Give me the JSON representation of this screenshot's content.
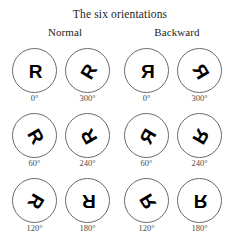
{
  "figure": {
    "title": "The six orientations",
    "circle_stroke_color": "#6b6b6b",
    "glyph_color": "#000000",
    "label_color": "#4a4a4a",
    "background_color": "#ffffff"
  },
  "groups": [
    {
      "key": "normal",
      "header": "Normal",
      "mirrored": false,
      "cells": [
        {
          "letter": "R",
          "rotation": 0,
          "degree_label": "0°"
        },
        {
          "letter": "R",
          "rotation": 300,
          "degree_label": "300°"
        },
        {
          "letter": "R",
          "rotation": 60,
          "degree_label": "60°"
        },
        {
          "letter": "R",
          "rotation": 240,
          "degree_label": "240°"
        },
        {
          "letter": "R",
          "rotation": 120,
          "degree_label": "120°"
        },
        {
          "letter": "R",
          "rotation": 180,
          "degree_label": "180°"
        }
      ]
    },
    {
      "key": "backward",
      "header": "Backward",
      "mirrored": true,
      "cells": [
        {
          "letter": "R",
          "rotation": 0,
          "degree_label": "0°"
        },
        {
          "letter": "R",
          "rotation": 300,
          "degree_label": "300°"
        },
        {
          "letter": "R",
          "rotation": 60,
          "degree_label": "60°"
        },
        {
          "letter": "R",
          "rotation": 240,
          "degree_label": "240°"
        },
        {
          "letter": "R",
          "rotation": 120,
          "degree_label": "120°"
        },
        {
          "letter": "R",
          "rotation": 180,
          "degree_label": "180°"
        }
      ]
    }
  ]
}
